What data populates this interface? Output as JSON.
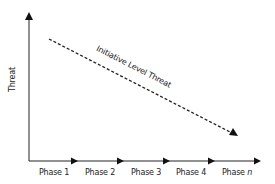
{
  "diagram": {
    "y_axis_label": "Threat",
    "trend_line_label": "Initiative Level Threat",
    "phases": [
      {
        "label": "Phase 1"
      },
      {
        "label": "Phase 2"
      },
      {
        "label": "Phase 3"
      },
      {
        "label": "Phase 4"
      },
      {
        "label": "Phase ",
        "suffix_italic": "n"
      }
    ],
    "colors": {
      "axis": "#222222",
      "trend_line": "#222222",
      "background": "#ffffff"
    }
  }
}
